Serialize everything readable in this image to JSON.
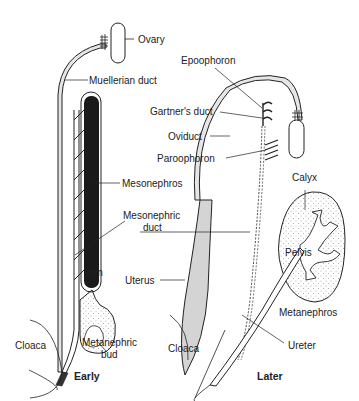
{
  "diagram": {
    "panels": [
      {
        "caption": "Early",
        "labels": {
          "ovary": "Ovary",
          "mullerian_duct": "Muellerian duct",
          "mesonephros": "Mesonephros",
          "mesonephric_duct_1": "Mesonephric",
          "mesonephric_duct_2": "duct",
          "nm": "nm",
          "cloaca": "Cloaca",
          "metanephric_bud_1": "Metanephric",
          "metanephric_bud_2": "bud"
        }
      },
      {
        "caption": "Later",
        "labels": {
          "epoophoron": "Epoophoron",
          "gartners_duct": "Gartner's duct",
          "oviduct": "Oviduct",
          "paroophoron": "Paroophoron",
          "calyx": "Calyx",
          "pelvis": "Pelvis",
          "uterus": "Uterus",
          "metanephros": "Metanephros",
          "cloaca": "Cloaca",
          "ureter": "Ureter"
        }
      }
    ],
    "colors": {
      "line": "#222222",
      "duct_fill": "#e6e6e6",
      "mesonephros_fill": "#1a1a1a",
      "uterus_fill": "#d4d4d4",
      "stipple": "#9a9a9a"
    }
  }
}
